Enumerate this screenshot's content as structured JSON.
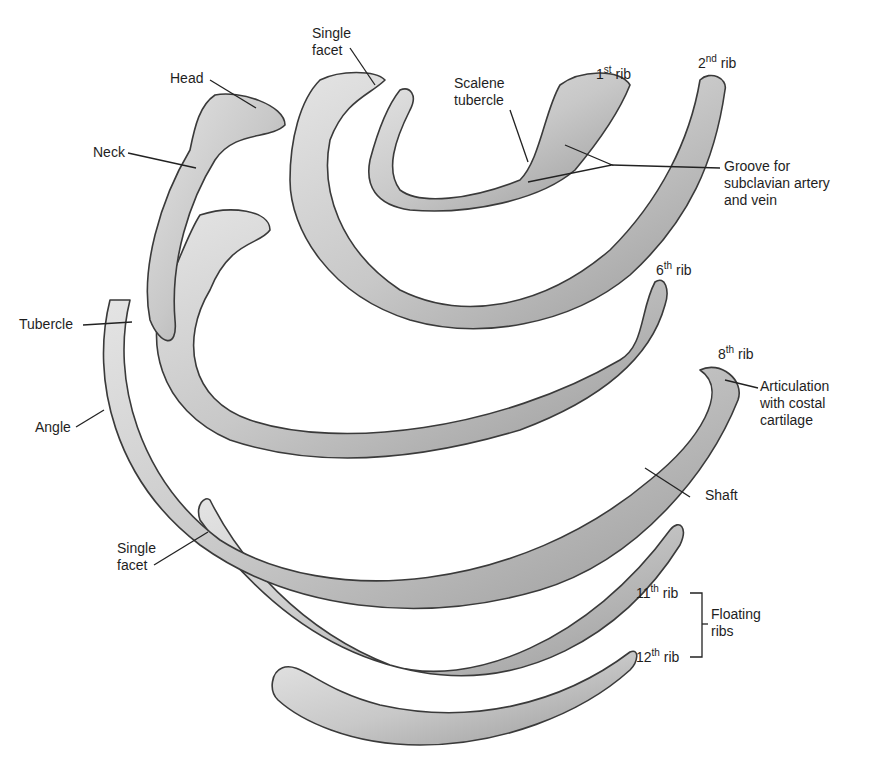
{
  "figure": {
    "colors": {
      "bone_fill": "#d2d2d2",
      "bone_shadow": "#8f8f8f",
      "bone_outline": "#3a3a3a",
      "leader": "#222222",
      "background": "#ffffff"
    }
  },
  "labels": {
    "head": "Head",
    "neck": "Neck",
    "tubercle": "Tubercle",
    "angle": "Angle",
    "single_facet_top_line1": "Single",
    "single_facet_top_line2": "facet",
    "single_facet_bottom_line1": "Single",
    "single_facet_bottom_line2": "facet",
    "scalene_line1": "Scalene",
    "scalene_line2": "tubercle",
    "groove_line1": "Groove for",
    "groove_line2": "subclavian artery",
    "groove_line3": "and vein",
    "articulation_line1": "Articulation",
    "articulation_line2": "with costal",
    "articulation_line3": "cartilage",
    "shaft": "Shaft",
    "floating_line1": "Floating",
    "floating_line2": "ribs"
  },
  "rib_labels": [
    {
      "num": "1",
      "suffix": "st",
      "word": "rib"
    },
    {
      "num": "2",
      "suffix": "nd",
      "word": "rib"
    },
    {
      "num": "6",
      "suffix": "th",
      "word": "rib"
    },
    {
      "num": "8",
      "suffix": "th",
      "word": "rib"
    },
    {
      "num": "11",
      "suffix": "th",
      "word": "rib"
    },
    {
      "num": "12",
      "suffix": "th",
      "word": "rib"
    }
  ]
}
